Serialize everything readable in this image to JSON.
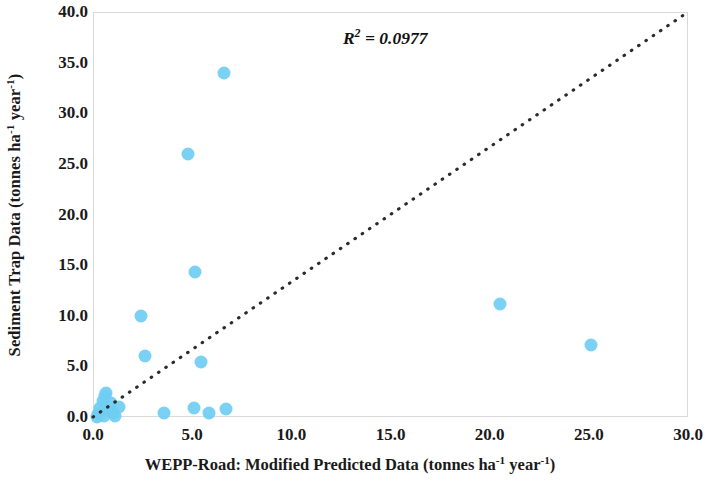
{
  "chart_data": {
    "type": "scatter",
    "title": "",
    "xlabel": "WEPP-Road: Modified Predicted Data (tonnes ha-1 year-1)",
    "ylabel": "Sediment Trap Data (tonnes ha-1 year-1)",
    "xlabel_parts": {
      "main": "WEPP-Road: Modified Predicted Data (tonnes ha",
      "sup1": "-1",
      "mid": " year",
      "sup2": "-1",
      "end": ")"
    },
    "ylabel_parts": {
      "main": "Sediment Trap Data (tonnes ha",
      "sup1": "-1",
      "mid": " year",
      "sup2": "-1",
      "end": ")"
    },
    "xlim": [
      0.0,
      30.0
    ],
    "ylim": [
      0.0,
      40.0
    ],
    "xticks": [
      "0.0",
      "5.0",
      "10.0",
      "15.0",
      "20.0",
      "25.0",
      "30.0"
    ],
    "xtick_values": [
      0.0,
      5.0,
      10.0,
      15.0,
      20.0,
      25.0,
      30.0
    ],
    "yticks": [
      "0.0",
      "5.0",
      "10.0",
      "15.0",
      "20.0",
      "25.0",
      "30.0",
      "35.0",
      "40.0"
    ],
    "ytick_values": [
      0.0,
      5.0,
      10.0,
      15.0,
      20.0,
      25.0,
      30.0,
      35.0,
      40.0
    ],
    "grid": false,
    "legend": null,
    "marker_color": "#6fcdf2",
    "annotations": [
      {
        "text": "R2 = 0.0977",
        "x": 12.6,
        "y": 37.2,
        "style": "bold-italic"
      }
    ],
    "r_squared": "0.0977",
    "r_squared_label": "R² = 0.0977",
    "trendline": {
      "style": "dotted",
      "color": "#2b2b2b",
      "from": [
        0.0,
        0.0
      ],
      "to": [
        30.0,
        40.0
      ]
    },
    "points": [
      {
        "x": 6.55,
        "y": 34.1
      },
      {
        "x": 4.75,
        "y": 26.1
      },
      {
        "x": 5.1,
        "y": 14.4
      },
      {
        "x": 20.45,
        "y": 11.3
      },
      {
        "x": 25.05,
        "y": 7.2
      },
      {
        "x": 2.35,
        "y": 10.1
      },
      {
        "x": 2.55,
        "y": 6.1
      },
      {
        "x": 5.4,
        "y": 5.5
      },
      {
        "x": 0.6,
        "y": 2.5
      },
      {
        "x": 0.55,
        "y": 2.2
      },
      {
        "x": 0.45,
        "y": 1.7
      },
      {
        "x": 0.85,
        "y": 1.5
      },
      {
        "x": 1.25,
        "y": 1.1
      },
      {
        "x": 0.3,
        "y": 1.0
      },
      {
        "x": 0.7,
        "y": 0.7
      },
      {
        "x": 0.95,
        "y": 0.5
      },
      {
        "x": 0.2,
        "y": 0.4
      },
      {
        "x": 0.5,
        "y": 0.2
      },
      {
        "x": 1.05,
        "y": 0.15
      },
      {
        "x": 0.15,
        "y": 0.1
      },
      {
        "x": 5.05,
        "y": 1.0
      },
      {
        "x": 5.8,
        "y": 0.45
      },
      {
        "x": 3.55,
        "y": 0.5
      },
      {
        "x": 6.65,
        "y": 0.9
      }
    ]
  }
}
